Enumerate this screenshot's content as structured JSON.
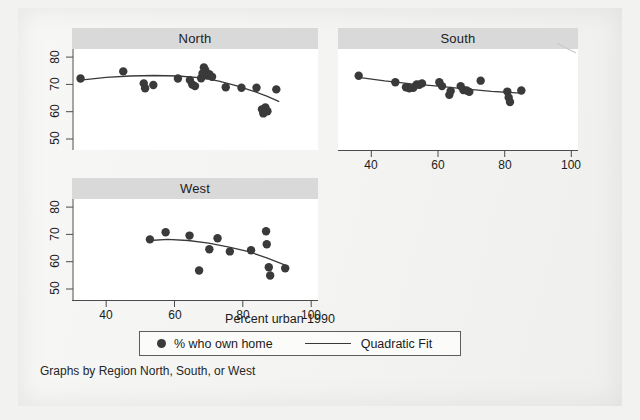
{
  "figure": {
    "caption": "Graphs by Region North, South, or West",
    "xlabel": "Percent urban 1990",
    "background_color": "#f2f2f0",
    "panel_header_color": "#d9d9d9",
    "marker_color": "#3a3a3a",
    "fit_line_color": "#3a3a3a"
  },
  "legend": {
    "marker_icon": "filled-circle",
    "marker_label": "% who own home",
    "line_icon": "solid-line",
    "line_label": "Quadratic Fit"
  },
  "chart_data": {
    "type": "scatter",
    "title": "",
    "xlabel": "Percent urban 1990",
    "ylabel": "",
    "xlim": [
      30,
      102
    ],
    "ylim": [
      47,
      84
    ],
    "xticks": [
      40,
      60,
      80,
      100
    ],
    "yticks": [
      50,
      60,
      70,
      80
    ],
    "grid": false,
    "legend_position": "bottom",
    "facet_label": "Region North, South, or West",
    "panels": [
      {
        "name": "North",
        "title": "North",
        "xlim": [
          30,
          102
        ],
        "ylim": [
          47,
          84
        ],
        "xticks": [
          40,
          60,
          80,
          100
        ],
        "yticks": [
          50,
          60,
          70,
          80
        ],
        "series": [
          {
            "name": "% who own home",
            "type": "scatter",
            "points": [
              [
                32.5,
                73.2
              ],
              [
                45.0,
                75.8
              ],
              [
                51.0,
                71.4
              ],
              [
                51.4,
                69.6
              ],
              [
                53.8,
                70.8
              ],
              [
                61.0,
                73.2
              ],
              [
                64.5,
                72.6
              ],
              [
                65.2,
                71.0
              ],
              [
                66.0,
                70.4
              ],
              [
                67.8,
                73.3
              ],
              [
                68.2,
                75.0
              ],
              [
                68.6,
                77.2
              ],
              [
                69.0,
                76.2
              ],
              [
                69.5,
                74.4
              ],
              [
                70.2,
                74.8
              ],
              [
                71.0,
                73.8
              ],
              [
                75.0,
                70.0
              ],
              [
                79.6,
                69.8
              ],
              [
                84.0,
                69.8
              ],
              [
                85.6,
                61.9
              ],
              [
                86.0,
                60.4
              ],
              [
                86.6,
                62.6
              ],
              [
                87.2,
                61.2
              ],
              [
                89.8,
                69.2
              ]
            ]
          },
          {
            "name": "Quadratic Fit",
            "type": "line",
            "points": [
              [
                32.5,
                72.6
              ],
              [
                40.0,
                73.6
              ],
              [
                47.0,
                74.1
              ],
              [
                54.0,
                74.3
              ],
              [
                61.0,
                74.1
              ],
              [
                68.0,
                73.4
              ],
              [
                73.0,
                72.2
              ],
              [
                78.0,
                70.6
              ],
              [
                83.0,
                68.6
              ],
              [
                87.0,
                66.7
              ],
              [
                90.5,
                64.8
              ]
            ]
          }
        ]
      },
      {
        "name": "South",
        "title": "South",
        "xlim": [
          30,
          102
        ],
        "ylim": [
          47,
          84
        ],
        "xticks": [
          40,
          60,
          80,
          100
        ],
        "yticks": [
          50,
          60,
          70,
          80
        ],
        "series": [
          {
            "name": "% who own home",
            "type": "scatter",
            "points": [
              [
                36.2,
                74.2
              ],
              [
                47.2,
                71.8
              ],
              [
                50.4,
                70.0
              ],
              [
                51.4,
                69.6
              ],
              [
                52.6,
                69.8
              ],
              [
                53.6,
                71.0
              ],
              [
                54.4,
                70.9
              ],
              [
                55.2,
                71.4
              ],
              [
                60.4,
                71.8
              ],
              [
                61.2,
                70.4
              ],
              [
                63.4,
                67.2
              ],
              [
                63.8,
                68.6
              ],
              [
                66.8,
                70.4
              ],
              [
                67.6,
                69.0
              ],
              [
                68.6,
                68.8
              ],
              [
                69.4,
                68.3
              ],
              [
                72.8,
                72.4
              ],
              [
                80.8,
                68.4
              ],
              [
                81.2,
                66.2
              ],
              [
                81.6,
                64.6
              ],
              [
                85.0,
                68.8
              ]
            ]
          },
          {
            "name": "Quadratic Fit",
            "type": "line",
            "points": [
              [
                36.2,
                73.6
              ],
              [
                44.0,
                72.3
              ],
              [
                52.0,
                71.2
              ],
              [
                60.0,
                70.4
              ],
              [
                68.0,
                69.4
              ],
              [
                76.0,
                68.5
              ],
              [
                85.0,
                67.8
              ]
            ]
          }
        ]
      },
      {
        "name": "West",
        "title": "West",
        "xlim": [
          30,
          102
        ],
        "ylim": [
          47,
          84
        ],
        "xticks": [
          40,
          60,
          80,
          100
        ],
        "yticks": [
          50,
          60,
          70,
          80
        ],
        "series": [
          {
            "name": "% who own home",
            "type": "scatter",
            "points": [
              [
                52.8,
                69.2
              ],
              [
                57.4,
                71.8
              ],
              [
                64.4,
                70.6
              ],
              [
                67.2,
                57.8
              ],
              [
                70.2,
                65.6
              ],
              [
                72.6,
                69.6
              ],
              [
                76.2,
                64.8
              ],
              [
                82.4,
                65.2
              ],
              [
                86.8,
                72.2
              ],
              [
                87.0,
                67.4
              ],
              [
                87.6,
                59.0
              ],
              [
                88.0,
                56.0
              ],
              [
                92.4,
                58.6
              ]
            ]
          },
          {
            "name": "Quadratic Fit",
            "type": "line",
            "points": [
              [
                52.8,
                68.8
              ],
              [
                58.0,
                69.2
              ],
              [
                64.0,
                68.8
              ],
              [
                70.0,
                67.8
              ],
              [
                76.0,
                66.4
              ],
              [
                82.0,
                64.6
              ],
              [
                87.0,
                62.4
              ],
              [
                92.4,
                59.8
              ]
            ]
          }
        ]
      }
    ]
  }
}
